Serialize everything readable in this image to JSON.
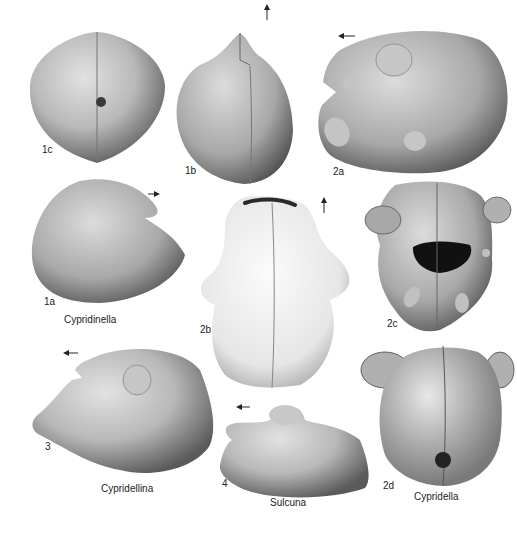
{
  "plate": {
    "background": "#ffffff",
    "specimens": [
      {
        "id": "1c",
        "label": "1c"
      },
      {
        "id": "1b",
        "label": "1b"
      },
      {
        "id": "2a",
        "label": "2a"
      },
      {
        "id": "1a",
        "label": "1a"
      },
      {
        "id": "2b",
        "label": "2b"
      },
      {
        "id": "2c",
        "label": "2c"
      },
      {
        "id": "3",
        "label": "3"
      },
      {
        "id": "4",
        "label": "4"
      },
      {
        "id": "2d",
        "label": "2d"
      }
    ],
    "genera": [
      {
        "name": "Cypridinella"
      },
      {
        "name": "Cypridellina"
      },
      {
        "name": "Sulcuna"
      },
      {
        "name": "Cypridella"
      }
    ],
    "arrows": [
      {
        "specimen": "1b",
        "direction": "up"
      },
      {
        "specimen": "2a",
        "direction": "left"
      },
      {
        "specimen": "1a",
        "direction": "right"
      },
      {
        "specimen": "2b",
        "direction": "up"
      },
      {
        "specimen": "3",
        "direction": "left"
      },
      {
        "specimen": "4",
        "direction": "left"
      }
    ]
  }
}
